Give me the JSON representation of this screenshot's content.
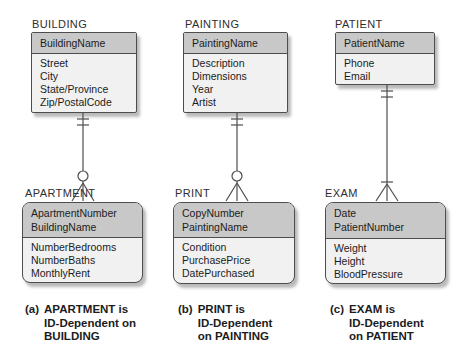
{
  "colors": {
    "bg": "#ffffff",
    "header_fill": "#c8c8c8",
    "body_fill": "#f1f1f1",
    "border": "#4d4d4d",
    "line": "#4d4d4d",
    "text": "#1c1c1c",
    "title": "#2e2e2e"
  },
  "columns": [
    {
      "parent": {
        "title": "BUILDING",
        "keys": [
          "BuildingName"
        ],
        "attributes": [
          "Street",
          "City",
          "State/Province",
          "Zip/PostalCode"
        ]
      },
      "relationship": {
        "parent_end": "one-mandatory (two ticks)",
        "child_end": "many-optional (circle + crow's foot)"
      },
      "child": {
        "title": "APARTMENT",
        "keys": [
          "ApartmentNumber",
          "BuildingName"
        ],
        "attributes": [
          "NumberBedrooms",
          "NumberBaths",
          "MonthlyRent"
        ]
      },
      "caption": {
        "marker": "(a)",
        "lines": [
          "APARTMENT is",
          "ID-Dependent on",
          "BUILDING"
        ]
      }
    },
    {
      "parent": {
        "title": "PAINTING",
        "keys": [
          "PaintingName"
        ],
        "attributes": [
          "Description",
          "Dimensions",
          "Year",
          "Artist"
        ]
      },
      "relationship": {
        "parent_end": "one-mandatory (two ticks)",
        "child_end": "many-optional (circle + crow's foot)"
      },
      "child": {
        "title": "PRINT",
        "keys": [
          "CopyNumber",
          "PaintingName"
        ],
        "attributes": [
          "Condition",
          "PurchasePrice",
          "DatePurchased"
        ]
      },
      "caption": {
        "marker": "(b)",
        "lines": [
          "PRINT is",
          "ID-Dependent",
          "on PAINTING"
        ]
      }
    },
    {
      "parent": {
        "title": "PATIENT",
        "keys": [
          "PatientName"
        ],
        "attributes": [
          "Phone",
          "Email"
        ]
      },
      "relationship": {
        "parent_end": "one-mandatory (two ticks)",
        "child_end": "many-mandatory (tick + crow's foot)"
      },
      "child": {
        "title": "EXAM",
        "keys": [
          "Date",
          "PatientNumber"
        ],
        "attributes": [
          "Weight",
          "Height",
          "BloodPressure"
        ]
      },
      "caption": {
        "marker": "(c)",
        "lines": [
          "EXAM is",
          "ID-Dependent",
          "on PATIENT"
        ]
      }
    }
  ]
}
